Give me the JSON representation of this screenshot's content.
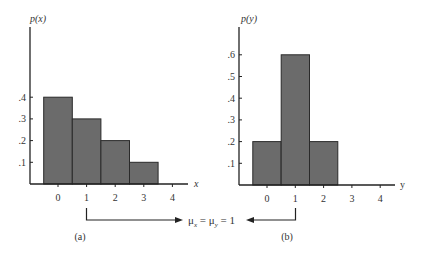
{
  "chart_data": [
    {
      "type": "bar",
      "panel_label": "(a)",
      "ylabel": "p(x)",
      "xlabel": "x",
      "categories": [
        "0",
        "1",
        "2",
        "3",
        "4"
      ],
      "values": [
        0.4,
        0.3,
        0.2,
        0.1,
        0
      ],
      "x_ticks": [
        "0",
        "1",
        "2",
        "3",
        "4"
      ],
      "y_ticks": [
        ".1",
        ".2",
        ".3",
        ".4"
      ],
      "ylim": [
        0,
        0.72
      ],
      "grid": false,
      "bar_color": "#6b6b6b"
    },
    {
      "type": "bar",
      "panel_label": "(b)",
      "ylabel": "p(y)",
      "xlabel": "y",
      "categories": [
        "0",
        "1",
        "2",
        "3",
        "4"
      ],
      "values": [
        0.2,
        0.6,
        0.2,
        0,
        0
      ],
      "x_ticks": [
        "0",
        "1",
        "2",
        "3",
        "4"
      ],
      "y_ticks": [
        ".1",
        ".2",
        ".3",
        ".4",
        ".5",
        ".6"
      ],
      "ylim": [
        0,
        0.72
      ],
      "grid": false,
      "bar_color": "#6b6b6b"
    }
  ],
  "annotation": {
    "text_mu_x": "μ",
    "sub_x": "x",
    "text_mid": " = μ",
    "sub_y": "y",
    "text_end": " = 1"
  }
}
